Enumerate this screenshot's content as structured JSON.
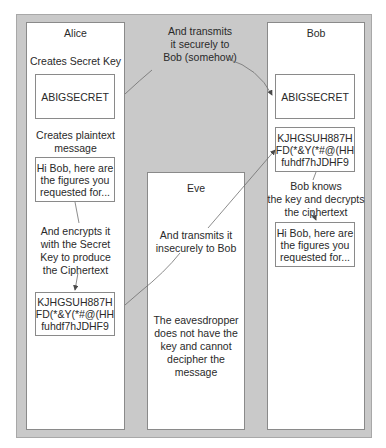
{
  "alice": {
    "title": "Alice",
    "step1": "Creates Secret Key",
    "key": "ABIGSECRET",
    "step2": "Creates plaintext\nmessage",
    "plaintext": "Hi Bob, here are\nthe figures you\nrequested for...",
    "step3": "And encrypts it\nwith the Secret\nKey to produce\nthe Ciphertext",
    "ciphertext": "KJHGSUH887H\nFD(*&Y(*#@(HH\nfuhdf7hJDHF9"
  },
  "transfer": {
    "secure": "And transmits\nit securely to\nBob (somehow)"
  },
  "eve": {
    "title": "Eve",
    "insecure": "And transmits it\ninsecurely to Bob",
    "note": "The eavesdropper\ndoes not have the\nkey and cannot\ndecipher the\nmessage"
  },
  "bob": {
    "title": "Bob",
    "key": "ABIGSECRET",
    "ciphertext": "KJHGSUH887H\nFD(*&Y(*#@(HH\nfuhdf7hJDHF9",
    "step": "Bob knows\nthe key and decrypts\nthe ciphertext",
    "plaintext": "Hi Bob, here are\nthe figures you\nrequested for..."
  },
  "colors": {
    "frame": "#c9c9c9",
    "panel": "#ffffff",
    "line": "#6e6e6e"
  }
}
